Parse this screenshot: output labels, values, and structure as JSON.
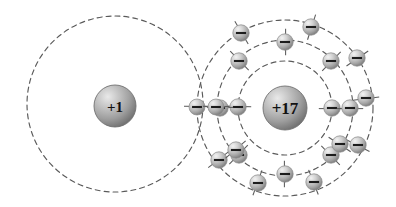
{
  "diagram": {
    "background_color": "#ffffff",
    "width": 396,
    "height": 207,
    "shell_stroke_color": "#5a5a5a",
    "shell_dash": "5 4",
    "electron_symbol": "−",
    "atoms": [
      {
        "id": "hydrogen",
        "nucleus_label": "+1",
        "nucleus_cx": 115,
        "nucleus_cy": 106,
        "nucleus_r": 21,
        "shells": [
          {
            "name": "shell-1",
            "cx": 115,
            "cy": 104,
            "r": 88,
            "electron_count": 1
          }
        ]
      },
      {
        "id": "chlorine",
        "nucleus_label": "+17",
        "nucleus_cx": 285,
        "nucleus_cy": 108,
        "nucleus_r": 22,
        "shells": [
          {
            "name": "shell-1",
            "cx": 285,
            "cy": 108,
            "r": 47,
            "electron_count": 2
          },
          {
            "name": "shell-2",
            "cx": 285,
            "cy": 108,
            "r": 68,
            "electron_count": 8
          },
          {
            "name": "shell-3",
            "cx": 285,
            "cy": 108,
            "r": 88,
            "electron_count": 8
          }
        ]
      }
    ],
    "shared_pair": {
      "label": "shared electron pair",
      "electrons": [
        {
          "cx": 197,
          "cy": 107
        },
        {
          "cx": 216,
          "cy": 107
        }
      ]
    },
    "electrons": [
      {
        "id": "cl-k-1",
        "shell": "chlorine-shell-1",
        "cx": 238,
        "cy": 107
      },
      {
        "id": "cl-k-2",
        "shell": "chlorine-shell-1",
        "cx": 332,
        "cy": 108
      },
      {
        "id": "cl-l-1",
        "shell": "chlorine-shell-2",
        "cx": 285,
        "cy": 42
      },
      {
        "id": "cl-l-2",
        "shell": "chlorine-shell-2",
        "cx": 331,
        "cy": 61
      },
      {
        "id": "cl-l-3",
        "shell": "chlorine-shell-2",
        "cx": 350,
        "cy": 108
      },
      {
        "id": "cl-l-4",
        "shell": "chlorine-shell-2",
        "cx": 331,
        "cy": 155
      },
      {
        "id": "cl-l-5",
        "shell": "chlorine-shell-2",
        "cx": 285,
        "cy": 174
      },
      {
        "id": "cl-l-6",
        "shell": "chlorine-shell-2",
        "cx": 239,
        "cy": 155
      },
      {
        "id": "cl-l-7",
        "shell": "chlorine-shell-2",
        "cx": 220,
        "cy": 108
      },
      {
        "id": "cl-l-8",
        "shell": "chlorine-shell-2",
        "cx": 239,
        "cy": 61
      },
      {
        "id": "cl-m-1",
        "shell": "chlorine-shell-3",
        "cx": 311,
        "cy": 27
      },
      {
        "id": "cl-m-2",
        "shell": "chlorine-shell-3",
        "cx": 357,
        "cy": 58
      },
      {
        "id": "cl-m-3",
        "shell": "chlorine-shell-3",
        "cx": 366,
        "cy": 98
      },
      {
        "id": "cl-m-4",
        "shell": "chlorine-shell-3",
        "cx": 358,
        "cy": 145
      },
      {
        "id": "cl-m-5",
        "shell": "chlorine-shell-3",
        "cx": 314,
        "cy": 182
      },
      {
        "id": "cl-m-6",
        "shell": "chlorine-shell-3",
        "cx": 258,
        "cy": 183
      },
      {
        "id": "cl-m-7",
        "shell": "chlorine-shell-3",
        "cx": 219,
        "cy": 160
      },
      {
        "id": "cl-m-8",
        "shell": "chlorine-shell-3",
        "cx": 241,
        "cy": 33
      },
      {
        "id": "cl-extra-1",
        "shell": "chlorine-shell-3",
        "cx": 340,
        "cy": 144
      },
      {
        "id": "cl-extra-2",
        "shell": "chlorine-shell-2",
        "cx": 236,
        "cy": 150
      }
    ]
  }
}
